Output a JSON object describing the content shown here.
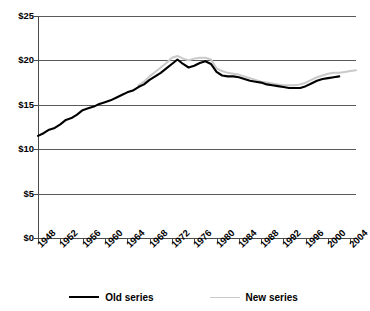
{
  "chart_data": {
    "type": "line",
    "title": "",
    "title_note": "partially-cropped-title",
    "xlabel": "",
    "ylabel": "",
    "xlim": [
      1948,
      2005
    ],
    "ylim": [
      0,
      25
    ],
    "ytick_labels": [
      "$0",
      "$5",
      "$10",
      "$15",
      "$20",
      "$25"
    ],
    "ytick_values": [
      0,
      5,
      10,
      15,
      20,
      25
    ],
    "xtick_labels": [
      "1948",
      "1952",
      "1956",
      "1960",
      "1964",
      "1968",
      "1972",
      "1976",
      "1980",
      "1984",
      "1988",
      "1992",
      "1996",
      "2000",
      "2004"
    ],
    "xtick_values": [
      1948,
      1952,
      1956,
      1960,
      1964,
      1968,
      1972,
      1976,
      1980,
      1984,
      1988,
      1992,
      1996,
      2000,
      2004
    ],
    "grid": true,
    "legend_position": "bottom",
    "series": [
      {
        "name": "Old series",
        "color": "#000000",
        "x": [
          1948,
          1949,
          1950,
          1951,
          1952,
          1953,
          1954,
          1955,
          1956,
          1957,
          1958,
          1959,
          1960,
          1961,
          1962,
          1963,
          1964,
          1965,
          1966,
          1967,
          1968,
          1969,
          1970,
          1971,
          1972,
          1973,
          1974,
          1975,
          1976,
          1977,
          1978,
          1979,
          1980,
          1981,
          1982,
          1983,
          1984,
          1985,
          1986,
          1987,
          1988,
          1989,
          1990,
          1991,
          1992,
          1993,
          1994,
          1995,
          1996,
          1997,
          1998,
          1999,
          2000,
          2001,
          2002
        ],
        "values": [
          11.5,
          11.8,
          12.2,
          12.4,
          12.8,
          13.3,
          13.5,
          13.9,
          14.4,
          14.6,
          14.8,
          15.1,
          15.3,
          15.5,
          15.8,
          16.1,
          16.4,
          16.6,
          17.0,
          17.3,
          17.8,
          18.2,
          18.6,
          19.1,
          19.6,
          20.1,
          19.6,
          19.2,
          19.4,
          19.7,
          19.9,
          19.6,
          18.7,
          18.3,
          18.2,
          18.2,
          18.1,
          17.9,
          17.7,
          17.6,
          17.5,
          17.3,
          17.2,
          17.1,
          17.0,
          16.9,
          16.9,
          16.9,
          17.1,
          17.4,
          17.7,
          17.9,
          18.0,
          18.1,
          18.2
        ]
      },
      {
        "name": "New series",
        "color": "#c9c9c9",
        "x": [
          1966,
          1967,
          1968,
          1969,
          1970,
          1971,
          1972,
          1973,
          1974,
          1975,
          1976,
          1977,
          1978,
          1979,
          1980,
          1981,
          1982,
          1983,
          1984,
          1985,
          1986,
          1987,
          1988,
          1989,
          1990,
          1991,
          1992,
          1993,
          1994,
          1995,
          1996,
          1997,
          1998,
          1999,
          2000,
          2001,
          2002,
          2003,
          2004,
          2005
        ],
        "values": [
          17.2,
          17.6,
          18.2,
          18.7,
          19.2,
          19.7,
          20.3,
          20.5,
          20.2,
          20.0,
          20.2,
          20.3,
          20.3,
          20.1,
          19.1,
          18.8,
          18.6,
          18.5,
          18.4,
          18.2,
          18.0,
          17.8,
          17.6,
          17.5,
          17.4,
          17.3,
          17.2,
          17.2,
          17.2,
          17.3,
          17.5,
          17.8,
          18.1,
          18.3,
          18.5,
          18.6,
          18.6,
          18.7,
          18.8,
          18.9
        ]
      }
    ]
  },
  "legend": {
    "items": [
      {
        "label": "Old series",
        "style": "old"
      },
      {
        "label": "New series",
        "style": "new"
      }
    ]
  }
}
